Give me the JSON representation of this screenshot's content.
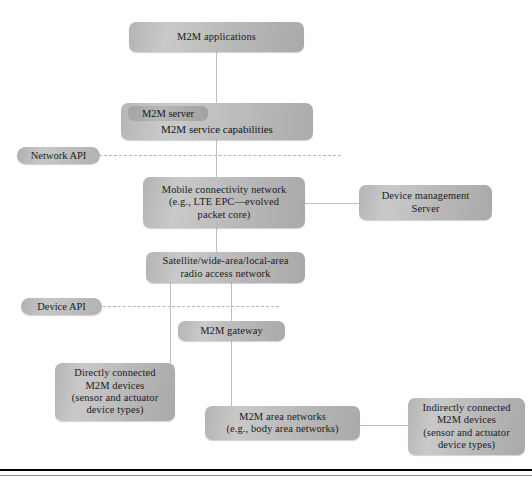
{
  "diagram": {
    "colors": {
      "box_fill_light": "#cacaca",
      "box_fill_dark": "#a9a9a9",
      "connector": "#bfbfbf",
      "dashed": "#b5b5b5",
      "rule": "#000000",
      "text": "#1b1b1b"
    },
    "nodes": {
      "m2m_applications": {
        "label": "M2M applications"
      },
      "m2m_server_group": {
        "title": "M2M server",
        "subtitle": "M2M service capabilities"
      },
      "network_api": {
        "label": "Network API"
      },
      "mobile_core": {
        "line1": "Mobile connectivity network",
        "line2": "(e.g., LTE EPC—evolved",
        "line3": "packet core)"
      },
      "device_management_server": {
        "line1": "Device management",
        "line2": "Server"
      },
      "radio_access": {
        "line1": "Satellite/wide-area/local-area",
        "line2": "radio access network"
      },
      "device_api": {
        "label": "Device API"
      },
      "m2m_gateway": {
        "label": "M2M gateway"
      },
      "directly_connected_devices": {
        "line1": "Directly connected",
        "line2": "M2M devices",
        "line3": "(sensor and actuator",
        "line4": "device types)"
      },
      "m2m_area_networks": {
        "line1": "M2M area networks",
        "line2": "(e.g., body area networks)"
      },
      "indirectly_connected_devices": {
        "line1": "Indirectly connected",
        "line2": "M2M devices",
        "line3": "(sensor and actuator",
        "line4": "device types)"
      }
    }
  }
}
